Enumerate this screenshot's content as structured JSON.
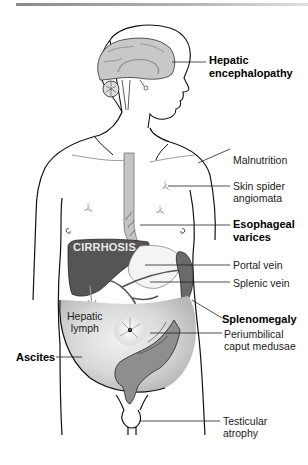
{
  "figure": {
    "organ_label": "CIRRHOSIS",
    "inner_label": [
      "Hepatic",
      "lymph"
    ],
    "labels_right": [
      {
        "id": "hepatic-encephalopathy",
        "lines": [
          "Hepatic",
          "encephalopathy"
        ],
        "bold": true
      },
      {
        "id": "malnutrition",
        "lines": [
          "Malnutrition"
        ],
        "bold": false
      },
      {
        "id": "skin-spider-angiomata",
        "lines": [
          "Skin spider",
          "angiomata"
        ],
        "bold": false
      },
      {
        "id": "esophageal-varices",
        "lines": [
          "Esophageal",
          "varices"
        ],
        "bold": true
      },
      {
        "id": "portal-vein",
        "lines": [
          "Portal vein"
        ],
        "bold": false
      },
      {
        "id": "splenic-vein",
        "lines": [
          "Splenic vein"
        ],
        "bold": false
      },
      {
        "id": "splenomegaly",
        "lines": [
          "Splenomegaly"
        ],
        "bold": true
      },
      {
        "id": "periumbilical-caput-medusae",
        "lines": [
          "Periumbilical",
          "caput medusae"
        ],
        "bold": false
      },
      {
        "id": "testicular-atrophy",
        "lines": [
          "Testicular",
          "atrophy"
        ],
        "bold": false
      }
    ],
    "labels_left": [
      {
        "id": "ascites",
        "lines": [
          "Ascites"
        ],
        "bold": true
      }
    ],
    "colors": {
      "outline": "#111111",
      "brain": "#c8c8c8",
      "esophagus": "#bdbdbd",
      "liver": "#555555",
      "spleen": "#6a6a6a",
      "ascites_fill": "#d0d0d0",
      "intestine": "#8a8a8a",
      "top_rule": "#9a9a9a"
    }
  }
}
